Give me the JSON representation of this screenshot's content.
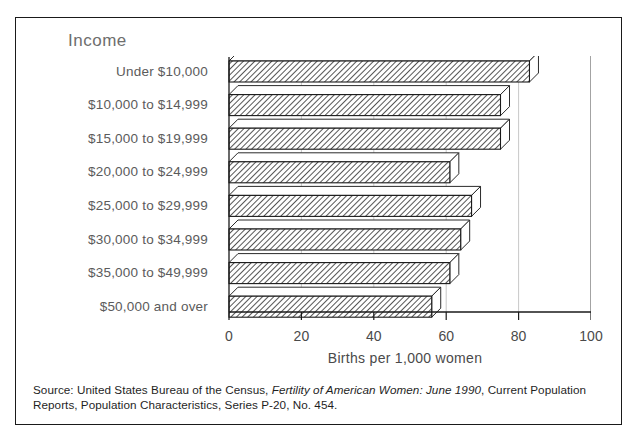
{
  "figure": {
    "title": "Income",
    "source_prefix": "Source: United States Bureau of the Census, ",
    "source_italic": "Fertility of American Women: June 1990",
    "source_suffix": ", Current Population Reports, Population Characteristics, Series P-20, No. 454."
  },
  "chart_data": {
    "type": "bar",
    "orientation": "horizontal",
    "title": "Income",
    "xlabel": "Births per 1,000 women",
    "ylabel": "Income",
    "xlim": [
      0,
      100
    ],
    "xticks": [
      0,
      20,
      40,
      60,
      80,
      100
    ],
    "xtick_labels": [
      "0",
      "20",
      "40",
      "60",
      "80",
      "100"
    ],
    "grid": true,
    "legend": false,
    "categories": [
      "Under $10,000",
      "$10,000 to $14,999",
      "$15,000 to $19,999",
      "$20,000 to $24,999",
      "$25,000 to $29,999",
      "$30,000 to $34,999",
      "$35,000 to $49,999",
      "$50,000 and over"
    ],
    "values": [
      83,
      75,
      75,
      61,
      67,
      64,
      61,
      56
    ],
    "bar_style": {
      "fill": "hatched",
      "edge_color": "#1a1a1a",
      "face_color": "#ffffff",
      "three_d": true
    }
  }
}
